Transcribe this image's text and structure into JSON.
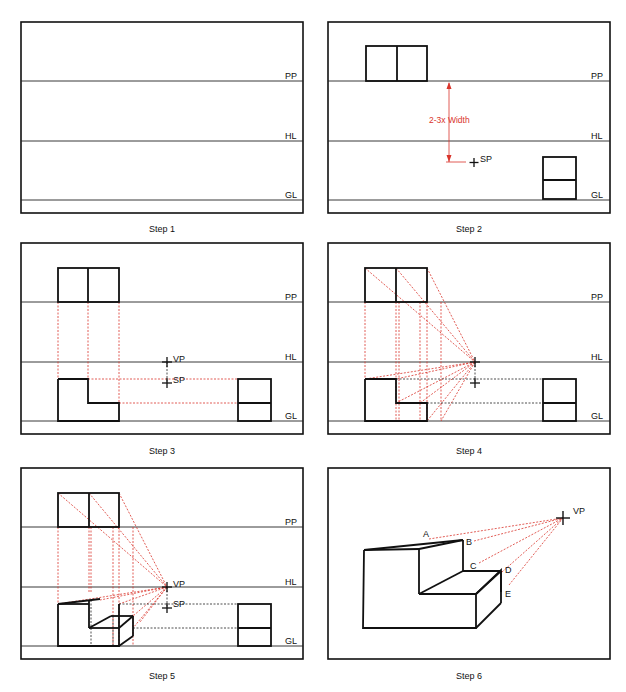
{
  "line_labels": {
    "picture_plane": "PP",
    "horizon_line": "HL",
    "ground_line": "GL"
  },
  "point_labels": {
    "vanishing_point": "VP",
    "station_point": "SP"
  },
  "annotations": {
    "distance_note": "2-3x Width"
  },
  "colors": {
    "construction_line": "#d9342b",
    "object_line": "#111111"
  },
  "panels": [
    {
      "caption": "Step 1"
    },
    {
      "caption": "Step 2"
    },
    {
      "caption": "Step 3"
    },
    {
      "caption": "Step 4"
    },
    {
      "caption": "Step 5"
    },
    {
      "caption": "Step 6"
    }
  ],
  "step6_points": [
    "A",
    "B",
    "C",
    "D",
    "E"
  ]
}
